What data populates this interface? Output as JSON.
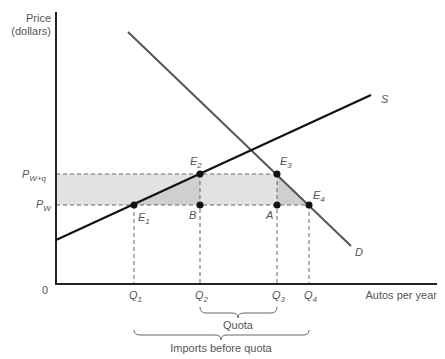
{
  "axes": {
    "y_label_line1": "Price",
    "y_label_line2": "(dollars)",
    "x_label": "Autos per year",
    "origin": "0"
  },
  "price_levels": {
    "pwq": {
      "main": "P",
      "sub": "W+q"
    },
    "pw": {
      "main": "P",
      "sub": "W"
    }
  },
  "quantity_ticks": [
    {
      "main": "Q",
      "sub": "1"
    },
    {
      "main": "Q",
      "sub": "2"
    },
    {
      "main": "Q",
      "sub": "3"
    },
    {
      "main": "Q",
      "sub": "4"
    }
  ],
  "curves": {
    "supply": "S",
    "demand": "D"
  },
  "points": {
    "e1": {
      "main": "E",
      "sub": "1"
    },
    "e2": {
      "main": "E",
      "sub": "2"
    },
    "e3": {
      "main": "E",
      "sub": "3"
    },
    "e4": {
      "main": "E",
      "sub": "4"
    },
    "b": "B",
    "a": "A"
  },
  "braces": {
    "quota": "Quota",
    "imports": "Imports before quota"
  },
  "colors": {
    "shade_light": "#e2e2e2",
    "shade_dark": "#cfcfcf",
    "supply_line": "#111111",
    "demand_line": "#555555"
  }
}
